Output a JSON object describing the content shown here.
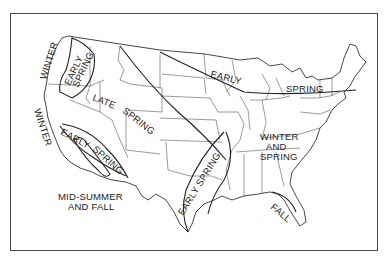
{
  "map": {
    "title": "",
    "region": "Contiguous United States",
    "zones": [
      {
        "id": "winter-northwest",
        "label": "WINTER"
      },
      {
        "id": "early-spring-northwest",
        "label": "EARLY SPRING",
        "lines": [
          "EARLY",
          "SPRING"
        ]
      },
      {
        "id": "late-spring",
        "label": "LATE SPRING",
        "lines": [
          "LATE",
          "SPRING"
        ]
      },
      {
        "id": "winter-california",
        "label": "WINTER"
      },
      {
        "id": "early-spring-california",
        "label": "EARLY SPRING",
        "lines": [
          "EARLY",
          "SPRING"
        ]
      },
      {
        "id": "mid-summer-fall",
        "label": "MID-SUMMER AND FALL",
        "lines": [
          "MID-SUMMER",
          "AND FALL"
        ]
      },
      {
        "id": "early-spring-south",
        "label": "EARLY SPRING"
      },
      {
        "id": "early-spring-north",
        "label": "EARLY SPRING",
        "lines": [
          "EARLY",
          "SPRING"
        ]
      },
      {
        "id": "winter-and-spring",
        "label": "WINTER AND SPRING",
        "lines": [
          "WINTER",
          "AND",
          "SPRING"
        ]
      },
      {
        "id": "fall-florida",
        "label": "FALL"
      }
    ]
  },
  "colors": {
    "line": "#222222",
    "background": "#ffffff",
    "border": "#4a4a4a"
  }
}
